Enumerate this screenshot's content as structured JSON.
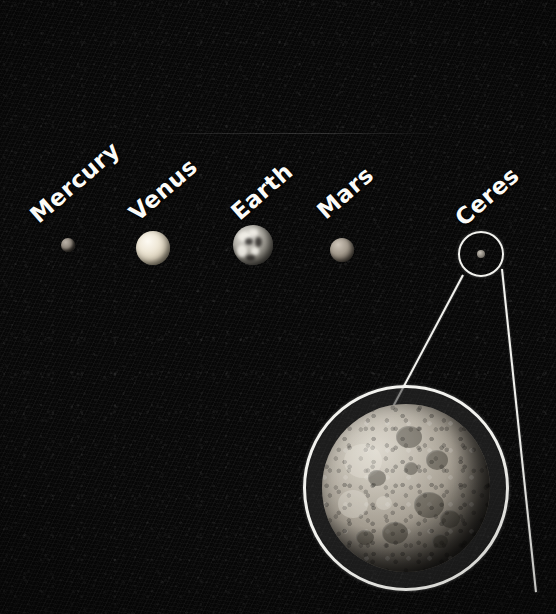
{
  "figure": {
    "type": "astronomy-size-comparison",
    "background_color": "#070707",
    "line_color": "#f2f2ee",
    "label_color": "#fbfbf8"
  },
  "bodies": [
    {
      "name": "Mercury",
      "label": "Mercury",
      "cx": 68,
      "cy": 245,
      "radius": 7,
      "label_x": 42,
      "label_y": 202,
      "label_rotation": -41
    },
    {
      "name": "Venus",
      "label": "Venus",
      "cx": 153,
      "cy": 248,
      "radius": 17,
      "label_x": 141,
      "label_y": 200,
      "label_rotation": -41
    },
    {
      "name": "Earth",
      "label": "Earth",
      "cx": 253,
      "cy": 245,
      "radius": 20,
      "label_x": 243,
      "label_y": 199,
      "label_rotation": -41
    },
    {
      "name": "Mars",
      "label": "Mars",
      "cx": 342,
      "cy": 250,
      "radius": 12,
      "label_x": 329,
      "label_y": 198,
      "label_rotation": -41
    },
    {
      "name": "Ceres",
      "label": "Ceres",
      "cx": 481,
      "cy": 254,
      "radius": 4,
      "label_x": 467,
      "label_y": 205,
      "label_rotation": -41
    }
  ],
  "callout": {
    "source_circle": {
      "cx": 481,
      "cy": 254,
      "radius": 23
    },
    "magnified_circle": {
      "cx": 406,
      "cy": 488,
      "radius": 103
    },
    "magnified_body": "Ceres",
    "connector_lines": 2
  },
  "scratch": {
    "x": 150,
    "y": 133,
    "width": 300
  }
}
